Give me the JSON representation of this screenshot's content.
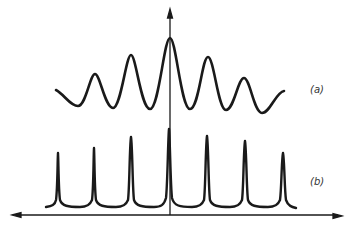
{
  "figure": {
    "type": "diagram",
    "curves": [
      {
        "id": "a",
        "label": "(a)",
        "style": "broad smooth fringes",
        "peaks": 7
      },
      {
        "id": "b",
        "label": "(b)",
        "style": "sharp narrow peaks",
        "peaks": 7
      }
    ],
    "labels": {
      "a": "(a)",
      "b": "(b)"
    },
    "colors": {
      "line": "#1a1a1a",
      "background": "#ffffff"
    }
  }
}
